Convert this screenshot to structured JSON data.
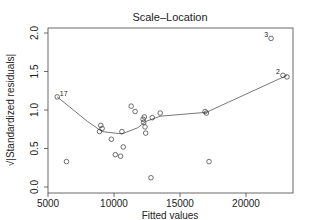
{
  "chart_data": {
    "type": "scatter",
    "title": "Scale–Location",
    "xlabel": "Fitted values",
    "subtitle": "lm(crime ~ pop + income + jiga)",
    "ylabel": "√|Standardized residuals|",
    "xlim": [
      5000,
      23500
    ],
    "ylim": [
      0.0,
      2.0
    ],
    "xticks": [
      5000,
      10000,
      15000,
      20000
    ],
    "yticks": [
      0.0,
      0.5,
      1.0,
      1.5,
      2.0
    ],
    "grid": false,
    "points": [
      {
        "x": 5700,
        "y": 1.17,
        "label": "17"
      },
      {
        "x": 6400,
        "y": 0.33
      },
      {
        "x": 8900,
        "y": 0.72
      },
      {
        "x": 9000,
        "y": 0.8
      },
      {
        "x": 9100,
        "y": 0.76
      },
      {
        "x": 9800,
        "y": 0.62
      },
      {
        "x": 10100,
        "y": 0.42
      },
      {
        "x": 10500,
        "y": 0.4
      },
      {
        "x": 10600,
        "y": 0.72
      },
      {
        "x": 10700,
        "y": 0.52
      },
      {
        "x": 11300,
        "y": 1.05
      },
      {
        "x": 11600,
        "y": 0.98
      },
      {
        "x": 12200,
        "y": 0.88
      },
      {
        "x": 12250,
        "y": 0.84
      },
      {
        "x": 12300,
        "y": 0.91
      },
      {
        "x": 12350,
        "y": 0.78
      },
      {
        "x": 12400,
        "y": 0.7
      },
      {
        "x": 12800,
        "y": 0.12
      },
      {
        "x": 12900,
        "y": 0.9
      },
      {
        "x": 13500,
        "y": 0.96
      },
      {
        "x": 16900,
        "y": 0.98
      },
      {
        "x": 17000,
        "y": 0.96
      },
      {
        "x": 17200,
        "y": 0.33
      },
      {
        "x": 21900,
        "y": 1.93,
        "label": "3"
      },
      {
        "x": 22800,
        "y": 1.45,
        "label": "2"
      },
      {
        "x": 23100,
        "y": 1.43
      }
    ],
    "smooth_line": [
      {
        "x": 5700,
        "y": 1.17
      },
      {
        "x": 8000,
        "y": 0.85
      },
      {
        "x": 9100,
        "y": 0.72
      },
      {
        "x": 10600,
        "y": 0.69
      },
      {
        "x": 11800,
        "y": 0.77
      },
      {
        "x": 12400,
        "y": 0.85
      },
      {
        "x": 13500,
        "y": 0.92
      },
      {
        "x": 17000,
        "y": 0.97
      },
      {
        "x": 23100,
        "y": 1.45
      }
    ]
  }
}
